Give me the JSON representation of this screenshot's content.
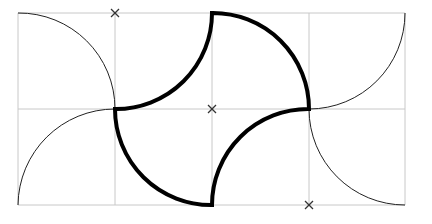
{
  "diagram": {
    "title": "",
    "grid": {
      "x": [
        18,
        115,
        212,
        309,
        405
      ],
      "y": [
        13,
        109,
        205
      ],
      "color": "#c8c8c8",
      "cell_size": 97
    },
    "thin_arcs": [
      {
        "from": [
          18,
          13
        ],
        "to": [
          115,
          109
        ],
        "center": [
          18,
          109
        ],
        "radius": 97
      },
      {
        "from": [
          18,
          205
        ],
        "to": [
          115,
          109
        ],
        "center": [
          115,
          205
        ],
        "radius": 97
      },
      {
        "from": [
          309,
          109
        ],
        "to": [
          405,
          13
        ],
        "center": [
          309,
          13
        ],
        "radius": 97
      },
      {
        "from": [
          309,
          109
        ],
        "to": [
          405,
          205
        ],
        "center": [
          405,
          109
        ],
        "radius": 97
      }
    ],
    "bold_shape": {
      "color": "#000000",
      "stroke_width": 4,
      "arcs": [
        {
          "from": [
            115,
            109
          ],
          "to": [
            212,
            13
          ],
          "center": [
            115,
            13
          ]
        },
        {
          "from": [
            212,
            13
          ],
          "to": [
            309,
            109
          ],
          "center": [
            212,
            109
          ]
        },
        {
          "from": [
            309,
            109
          ],
          "to": [
            212,
            205
          ],
          "center": [
            309,
            205
          ]
        },
        {
          "from": [
            212,
            205
          ],
          "to": [
            115,
            109
          ],
          "center": [
            212,
            109
          ]
        }
      ]
    },
    "center_marks": [
      {
        "label": "x",
        "pos": [
          115,
          13
        ]
      },
      {
        "label": "x",
        "pos": [
          212,
          109
        ]
      },
      {
        "label": "x",
        "pos": [
          309,
          205
        ]
      }
    ]
  }
}
